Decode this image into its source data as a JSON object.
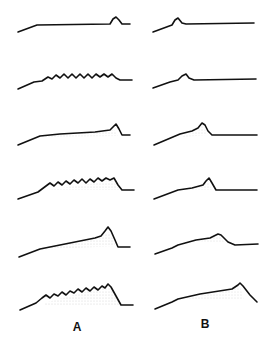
{
  "figure": {
    "columns": [
      {
        "label": "A",
        "x": 77
      },
      {
        "label": "B",
        "x": 205
      }
    ],
    "rows": 6,
    "ink": "#111111",
    "stipple": "#9a9a9a",
    "profiles": {
      "A": [
        {
          "row": 1,
          "type": "smooth-crest",
          "peak": "small-end-bump"
        },
        {
          "row": 2,
          "type": "rippled",
          "ripples": 9,
          "peak": "small-end-bump"
        },
        {
          "row": 3,
          "type": "smooth-rising",
          "peak": "end-crest"
        },
        {
          "row": 4,
          "type": "rippled",
          "ripples": 9,
          "peak": "steep-lee"
        },
        {
          "row": 5,
          "type": "smooth-rising",
          "peak": "large-end-crest"
        },
        {
          "row": 6,
          "type": "rippled",
          "ripples": 8,
          "peak": "large-steep-lee"
        }
      ],
      "B": [
        {
          "row": 1,
          "type": "smooth",
          "peak": "early-bump"
        },
        {
          "row": 2,
          "type": "smooth",
          "peak": "early-bump"
        },
        {
          "row": 3,
          "type": "smooth-rising",
          "peak": "mid-crest"
        },
        {
          "row": 4,
          "type": "smooth-rising",
          "peak": "mid-crest"
        },
        {
          "row": 5,
          "type": "smooth-rising",
          "peak": "late-crest"
        },
        {
          "row": 6,
          "type": "smooth-rising",
          "peak": "end-crest-drop"
        }
      ]
    }
  }
}
